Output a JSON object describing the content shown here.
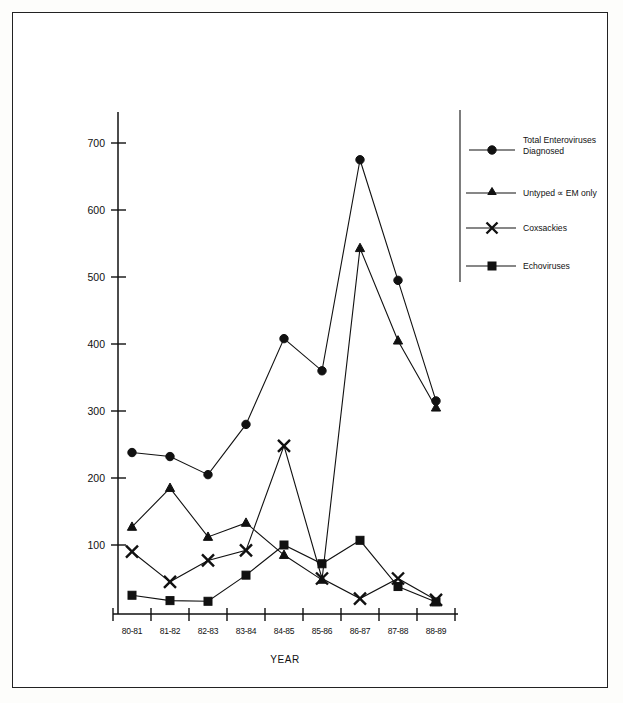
{
  "chart_data": {
    "type": "line",
    "title": "",
    "xlabel": "YEAR",
    "ylabel": "",
    "categories": [
      "80-81",
      "81-82",
      "82-83",
      "83-84",
      "84-85",
      "85-86",
      "86-87",
      "87-88",
      "88-89"
    ],
    "ylim": [
      0,
      740
    ],
    "yticks": [
      100,
      200,
      300,
      400,
      500,
      600,
      700
    ],
    "grid": false,
    "legend_position": "right",
    "series": [
      {
        "name": "Total Enteroviruses Diagnosed",
        "marker": "circle",
        "values": [
          238,
          232,
          205,
          280,
          408,
          360,
          675,
          495,
          315
        ]
      },
      {
        "name": "Untyped ∝ EM only",
        "marker": "triangle",
        "values": [
          127,
          185,
          112,
          133,
          85,
          48,
          543,
          405,
          305
        ]
      },
      {
        "name": "Coxsackies",
        "marker": "x",
        "values": [
          90,
          45,
          77,
          92,
          248,
          50,
          20,
          50,
          18
        ]
      },
      {
        "name": "Echoviruses",
        "marker": "square",
        "values": [
          25,
          17,
          16,
          55,
          100,
          72,
          107,
          38,
          15
        ]
      }
    ]
  },
  "axis": {
    "x_title": "YEAR",
    "y_tick_labels": [
      "700",
      "600",
      "500",
      "400",
      "300",
      "200",
      "100"
    ],
    "x_tick_labels": [
      "80-81",
      "81-82",
      "82-83",
      "83-84",
      "84-85",
      "85-86",
      "86-87",
      "87-88",
      "88-89"
    ]
  },
  "legend": {
    "items": [
      {
        "label_line1": "Total Enteroviruses",
        "label_line2": "Diagnosed",
        "marker": "circle-marker"
      },
      {
        "label_line1": "Untyped ∝  EM only",
        "label_line2": "",
        "marker": "triangle-marker"
      },
      {
        "label_line1": "Coxsackies",
        "label_line2": "",
        "marker": "x-marker"
      },
      {
        "label_line1": "Echoviruses",
        "label_line2": "",
        "marker": "square-marker"
      }
    ]
  },
  "style": {
    "ink": "#111111",
    "page": "#ffffff"
  }
}
